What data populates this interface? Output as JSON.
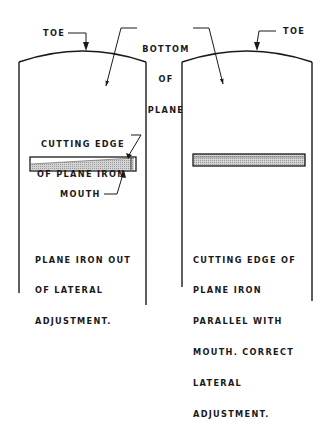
{
  "labels": {
    "toe_left": "TOE",
    "toe_right": "TOE",
    "bottom_of_plane": [
      "BOTTOM",
      "OF",
      "PLANE"
    ],
    "cutting_edge": [
      "CUTTING EDGE",
      "OF PLANE IRON"
    ],
    "mouth": "MOUTH"
  },
  "captions": {
    "left": [
      "PLANE IRON OUT",
      "OF LATERAL",
      "ADJUSTMENT."
    ],
    "right": [
      "CUTTING EDGE OF",
      "PLANE IRON",
      "PARALLEL WITH",
      "MOUTH. CORRECT",
      "LATERAL",
      "ADJUSTMENT."
    ]
  },
  "panels": [
    {
      "id": "left",
      "state": "out of lateral adjustment"
    },
    {
      "id": "right",
      "state": "correct lateral adjustment"
    }
  ],
  "colors": {
    "ink": "#1a1a1a",
    "hatch": "#bdbdbd",
    "background": "#ffffff"
  }
}
